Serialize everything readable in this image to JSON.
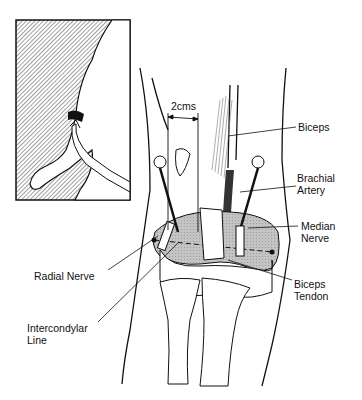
{
  "figure": {
    "inset": "arm-with-tourniquet-inset",
    "measurement": "2cms",
    "labels": {
      "biceps": "Biceps",
      "brachial_artery": "Brachial\nArtery",
      "median_nerve": "Median\nNerve",
      "radial_nerve": "Radial Nerve",
      "biceps_tendon": "Biceps\nTendon",
      "intercondylar_line": "Intercondylar\nLine"
    }
  },
  "colors": {
    "ink": "#111111",
    "hatch": "#8a8a8a",
    "shade": "#b8b8b8",
    "background": "#ffffff"
  }
}
